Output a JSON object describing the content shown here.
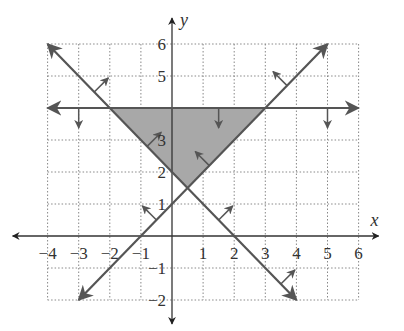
{
  "chart_data": {
    "type": "line",
    "title": "",
    "xlabel": "x",
    "ylabel": "y",
    "xlim": [
      -4,
      6
    ],
    "ylim": [
      -2,
      6
    ],
    "grid": true,
    "grid_style": "dotted",
    "x_ticks": [
      -4,
      -3,
      -2,
      -1,
      1,
      2,
      3,
      4,
      5,
      6
    ],
    "x_tick_labels": [
      "−4",
      "−3",
      "−2",
      "−1",
      "1",
      "2",
      "3",
      "4",
      "5",
      "6"
    ],
    "y_ticks": [
      -2,
      -1,
      1,
      2,
      3,
      5,
      6
    ],
    "y_tick_labels": [
      "−2",
      "−1",
      "1",
      "2",
      "3",
      "5",
      "6"
    ],
    "series": [
      {
        "name": "y = 4",
        "equation": "y = 4",
        "points": [
          [
            -4,
            4
          ],
          [
            6,
            4
          ]
        ],
        "arrowheads": "both",
        "shade_direction": "down",
        "inequality": "y ≤ 4"
      },
      {
        "name": "y = -x + 2",
        "equation": "y = -x + 2",
        "points": [
          [
            -4,
            6
          ],
          [
            4,
            -2
          ]
        ],
        "arrowheads": "both",
        "shade_direction": "up-right",
        "inequality": "y ≥ -x + 2"
      },
      {
        "name": "y = x + 1",
        "equation": "y = x + 1",
        "points": [
          [
            -3,
            -2
          ],
          [
            5,
            6
          ]
        ],
        "arrowheads": "both",
        "shade_direction": "up-left",
        "inequality": "y ≥ x + 1"
      }
    ],
    "shaded_region": {
      "vertices": [
        [
          -2,
          4
        ],
        [
          3,
          4
        ],
        [
          0.5,
          1.5
        ]
      ],
      "color": "#a8a8a8"
    },
    "colors": {
      "line": "#555555",
      "axis": "#333333",
      "grid": "#888888",
      "shade": "#a8a8a8"
    }
  }
}
